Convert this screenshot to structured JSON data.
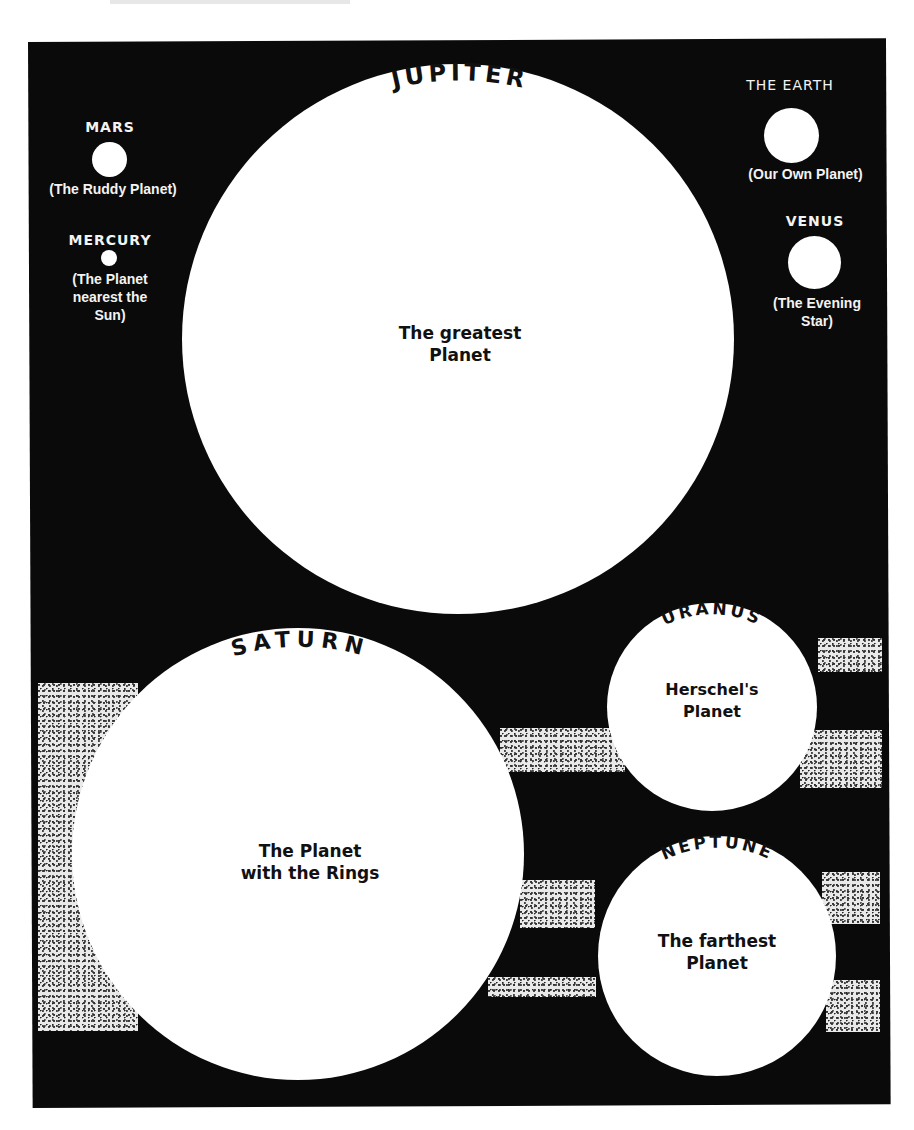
{
  "colors": {
    "background": "#0a0a0a",
    "planet": "#ffffff",
    "ring_stipple": "#e9e9e9",
    "label_on_dark": "#f3f3f3",
    "label_on_light": "#111111"
  },
  "planets": {
    "mars": {
      "name": "MARS",
      "description": "(The Ruddy Planet)"
    },
    "mercury": {
      "name": "MERCURY",
      "description_lines": [
        "(The Planet",
        "nearest the",
        "Sun)"
      ]
    },
    "earth": {
      "name": "THE EARTH",
      "description": "(Our Own Planet)"
    },
    "venus": {
      "name": "VENUS",
      "description_lines": [
        "(The Evening",
        "Star)"
      ]
    },
    "jupiter": {
      "name": "JUPITER",
      "description_lines": [
        "The greatest",
        "Planet"
      ]
    },
    "saturn": {
      "name": "SATURN",
      "description_lines": [
        "The Planet",
        "with the Rings"
      ]
    },
    "uranus": {
      "name": "URANUS",
      "description_lines": [
        "Herschel's",
        "Planet"
      ]
    },
    "neptune": {
      "name": "NEPTUNE",
      "description_lines": [
        "The farthest",
        "Planet"
      ]
    }
  }
}
